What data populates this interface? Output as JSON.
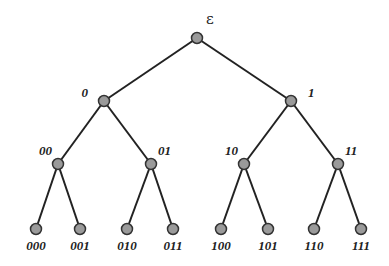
{
  "diagram": {
    "type": "binary-tree",
    "colors": {
      "edge": "#222222",
      "node_fill": "#9a9a9a",
      "node_stroke": "#333333",
      "label": "#222222"
    },
    "nodes": [
      {
        "id": "root",
        "label": "ε",
        "x": 197,
        "y": 38,
        "lx": 206,
        "ly": 24,
        "anchor": "start"
      },
      {
        "id": "0",
        "label": "0",
        "x": 104,
        "y": 101,
        "lx": 88,
        "ly": 97,
        "anchor": "end"
      },
      {
        "id": "1",
        "label": "1",
        "x": 291,
        "y": 101,
        "lx": 308,
        "ly": 97,
        "anchor": "start"
      },
      {
        "id": "00",
        "label": "00",
        "x": 58,
        "y": 164,
        "lx": 52,
        "ly": 155,
        "anchor": "end"
      },
      {
        "id": "01",
        "label": "01",
        "x": 151,
        "y": 164,
        "lx": 158,
        "ly": 155,
        "anchor": "start"
      },
      {
        "id": "10",
        "label": "10",
        "x": 244,
        "y": 164,
        "lx": 238,
        "ly": 155,
        "anchor": "end"
      },
      {
        "id": "11",
        "label": "11",
        "x": 338,
        "y": 164,
        "lx": 345,
        "ly": 155,
        "anchor": "start"
      },
      {
        "id": "000",
        "label": "000",
        "x": 36,
        "y": 229,
        "lx": 36,
        "ly": 250,
        "anchor": "middle"
      },
      {
        "id": "001",
        "label": "001",
        "x": 80,
        "y": 229,
        "lx": 80,
        "ly": 250,
        "anchor": "middle"
      },
      {
        "id": "010",
        "label": "010",
        "x": 127,
        "y": 229,
        "lx": 127,
        "ly": 250,
        "anchor": "middle"
      },
      {
        "id": "011",
        "label": "011",
        "x": 173,
        "y": 229,
        "lx": 173,
        "ly": 250,
        "anchor": "middle"
      },
      {
        "id": "100",
        "label": "100",
        "x": 221,
        "y": 229,
        "lx": 221,
        "ly": 250,
        "anchor": "middle"
      },
      {
        "id": "101",
        "label": "101",
        "x": 268,
        "y": 229,
        "lx": 268,
        "ly": 250,
        "anchor": "middle"
      },
      {
        "id": "110",
        "label": "110",
        "x": 314,
        "y": 229,
        "lx": 314,
        "ly": 250,
        "anchor": "middle"
      },
      {
        "id": "111",
        "label": "111",
        "x": 361,
        "y": 229,
        "lx": 361,
        "ly": 250,
        "anchor": "middle"
      }
    ],
    "edges": [
      [
        "root",
        "0"
      ],
      [
        "root",
        "1"
      ],
      [
        "0",
        "00"
      ],
      [
        "0",
        "01"
      ],
      [
        "1",
        "10"
      ],
      [
        "1",
        "11"
      ],
      [
        "00",
        "000"
      ],
      [
        "00",
        "001"
      ],
      [
        "01",
        "010"
      ],
      [
        "01",
        "011"
      ],
      [
        "10",
        "100"
      ],
      [
        "10",
        "101"
      ],
      [
        "11",
        "110"
      ],
      [
        "11",
        "111"
      ]
    ]
  }
}
